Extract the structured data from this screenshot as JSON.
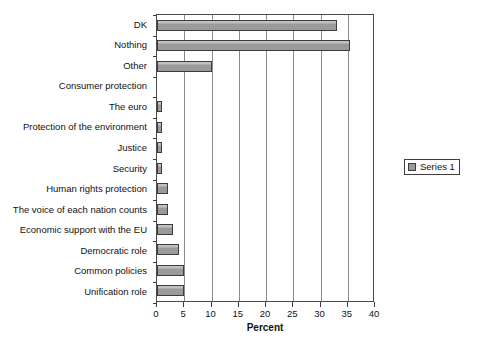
{
  "chart_data": {
    "type": "bar",
    "orientation": "horizontal",
    "title": "",
    "xlabel": "Percent",
    "ylabel": "",
    "xlim": [
      0,
      40
    ],
    "xticks": [
      0,
      5,
      10,
      15,
      20,
      25,
      30,
      35,
      40
    ],
    "xtick_labels": [
      "0",
      "5",
      "10",
      "15",
      "20",
      "25",
      "30",
      "35",
      "40"
    ],
    "grid": "vertical",
    "legend_position": "right",
    "legend": [
      "Series 1"
    ],
    "categories": [
      "DK",
      "Nothing",
      "Other",
      "Consumer protection",
      "The euro",
      "Protection of the environment",
      "Justice",
      "Security",
      "Human rights protection",
      "The voice of each nation counts",
      "Economic support with the EU",
      "Democratic role",
      "Common policies",
      "Unification role"
    ],
    "series": [
      {
        "name": "Series 1",
        "values": [
          33,
          35.5,
          10,
          0,
          1,
          1,
          1,
          1,
          2,
          2,
          3,
          4,
          5,
          5
        ]
      }
    ],
    "bar_color": "#9a9a9a",
    "bar_edge_color": "#3d3d3d"
  },
  "legend": {
    "entries": [
      {
        "label": "Series 1",
        "swatch_name": "series-1-swatch"
      }
    ]
  }
}
